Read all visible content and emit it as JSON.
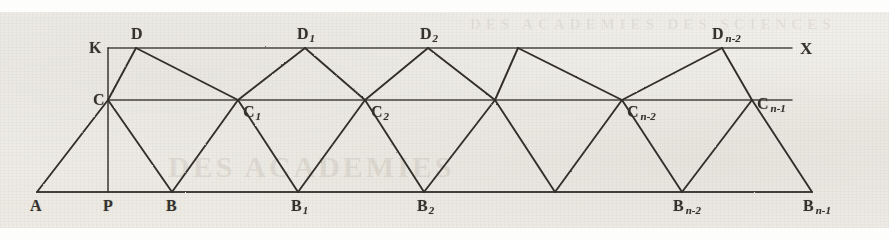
{
  "figure": {
    "kind": "geometric-truss-diagram",
    "ink_color": "#35322e",
    "paper_color": "#eeece6",
    "axis_label": "X",
    "ghost_text_middle": "DES ACADEMIES",
    "ghost_text_top": "DES ACADEMIES DES SCIENCES",
    "labels": {
      "A": "A",
      "P": "P",
      "K": "K",
      "C": "C",
      "D": "D",
      "B": "B",
      "B1_base": "B",
      "B1_sub": "1",
      "B2_base": "B",
      "B2_sub": "2",
      "Bn2_base": "B",
      "Bn2_sub": "n-2",
      "Bn1_base": "B",
      "Bn1_sub": "n-1",
      "C1_base": "C",
      "C1_sub": "1",
      "C2_base": "C",
      "C2_sub": "2",
      "Cn2_base": "C",
      "Cn2_sub": "n-2",
      "Cn1_base": "C",
      "Cn1_sub": "n-1",
      "D1_base": "D",
      "D1_sub": "1",
      "D2_base": "D",
      "D2_sub": "2",
      "Dn2_base": "D",
      "Dn2_sub": "n-2",
      "X": "X"
    },
    "lines": {
      "top_line_y": 48,
      "mid_line_y": 100,
      "base_line_y": 192,
      "top_line_x_start": 108,
      "top_line_x_end": 792,
      "mid_line_x_start": 108,
      "mid_line_x_end": 792,
      "base_line_x_start": 37,
      "base_line_x_end": 812
    },
    "vertices": {
      "A": [
        37,
        192
      ],
      "P": [
        108,
        192
      ],
      "K": [
        108,
        48
      ],
      "C": [
        108,
        100
      ],
      "D": [
        136,
        48
      ],
      "B": [
        172,
        192
      ],
      "C1": [
        238,
        100
      ],
      "B1": [
        298,
        192
      ],
      "D1": [
        305,
        48
      ],
      "C2": [
        365,
        100
      ],
      "B2": [
        424,
        192
      ],
      "D2": [
        428,
        48
      ],
      "Cm": [
        495,
        100
      ],
      "Dm": [
        518,
        48
      ],
      "Bm": [
        555,
        192
      ],
      "Cn2": [
        622,
        100
      ],
      "Bn2": [
        682,
        192
      ],
      "Dn2": [
        722,
        48
      ],
      "Cn1": [
        752,
        100
      ],
      "Bn1": [
        812,
        192
      ]
    }
  }
}
